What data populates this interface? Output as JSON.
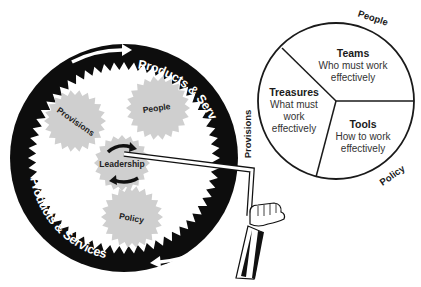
{
  "diagram": {
    "wheel": {
      "band_text_top": "Products & Services",
      "band_text_bottom": "Products & Services",
      "colors": {
        "band": "#0d0d0d",
        "gear": "#cfcfcf",
        "arrow": "#ffffff"
      }
    },
    "gears": [
      {
        "id": "provisions",
        "label": "Provisions"
      },
      {
        "id": "people",
        "label": "People"
      },
      {
        "id": "leadership",
        "label": "Leadership"
      },
      {
        "id": "policy",
        "label": "Policy"
      }
    ],
    "crank": {
      "description": "hand-turned crank attached to Leadership gear"
    },
    "pie": {
      "segments": [
        {
          "title": "Teams",
          "lines": [
            "Who must work",
            "effectively"
          ]
        },
        {
          "title": "Treasures",
          "lines": [
            "What must",
            "work",
            "effectively"
          ]
        },
        {
          "title": "Tools",
          "lines": [
            "How to work",
            "effectively"
          ]
        }
      ],
      "outer_labels": {
        "top": "People",
        "left": "Provisions",
        "bottom_right": "Policy"
      }
    }
  }
}
